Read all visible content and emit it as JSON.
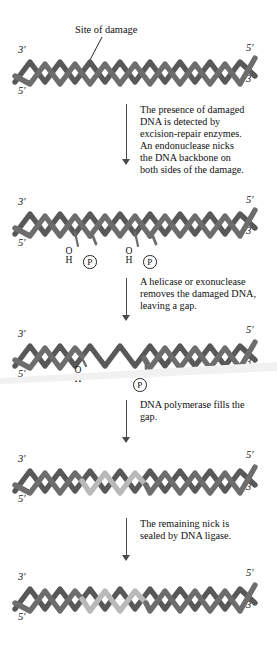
{
  "figure": {
    "damage_label": "Site of damage",
    "colors": {
      "strand_dark": "#595959",
      "strand_mid": "#6e6e6e",
      "strand_new": "#b9b9b9",
      "arrow": "#4a4a4a",
      "text": "#101010",
      "background": "#ffffff"
    }
  },
  "captions": [
    {
      "id": "caption-1",
      "text": "The presence of damaged\nDNA is detected by\nexcision-repair enzymes.\nAn endonuclease nicks\nthe DNA backbone on\nboth sides of the damage."
    },
    {
      "id": "caption-2",
      "text": "A helicase or exonuclease\nremoves the damaged DNA,\nleaving a gap."
    },
    {
      "id": "caption-3",
      "text": "DNA polymerase fills the\ngap."
    },
    {
      "id": "caption-4",
      "text": "The remaining nick is\nsealed by DNA ligase."
    }
  ],
  "stages": [
    {
      "id": "stage-1-damaged-dna",
      "name": "damaged-duplex",
      "left_primes": [
        "3′",
        "5′"
      ],
      "right_primes": [
        "5′",
        "3′"
      ],
      "markers": []
    },
    {
      "id": "stage-2-nicked-dna",
      "name": "nicked-duplex",
      "left_primes": [
        "3′",
        "5′"
      ],
      "right_primes": [
        "5′",
        "3′"
      ],
      "markers": [
        {
          "type": "hydroxyl",
          "o": "O",
          "h": "H"
        },
        {
          "type": "phosphate",
          "p": "P"
        },
        {
          "type": "hydroxyl",
          "o": "O",
          "h": "H"
        },
        {
          "type": "phosphate",
          "p": "P"
        }
      ]
    },
    {
      "id": "stage-3-gapped-dna",
      "name": "gapped-duplex",
      "left_primes": [
        "3′",
        "5′"
      ],
      "right_primes": [
        "5′",
        "3′"
      ],
      "markers": [
        {
          "type": "hydroxyl",
          "o": "O",
          "h": "H"
        },
        {
          "type": "phosphate",
          "p": "P"
        }
      ]
    },
    {
      "id": "stage-4-filled-dna",
      "name": "repaired-duplex-nicked",
      "left_primes": [
        "3′",
        "5′"
      ],
      "right_primes": [
        "5′",
        "3′"
      ],
      "markers": []
    },
    {
      "id": "stage-5-ligated-dna",
      "name": "sealed-duplex",
      "left_primes": [
        "3′",
        "5′"
      ],
      "right_primes": [
        "5′",
        "3′"
      ],
      "markers": []
    }
  ]
}
